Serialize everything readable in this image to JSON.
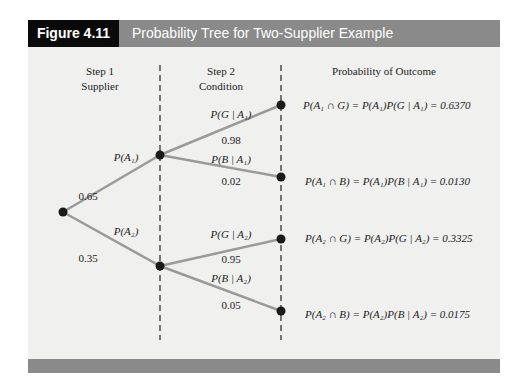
{
  "header": {
    "figure_label": "Figure 4.11",
    "title": "Probability Tree for Two-Supplier Example"
  },
  "columns": {
    "step1_line1": "Step 1",
    "step1_line2": "Supplier",
    "step2_line1": "Step 2",
    "step2_line2": "Condition",
    "outcome": "Probability of Outcome"
  },
  "branches": {
    "a1_label": "P(A₁)",
    "a1_value": "0.65",
    "a2_label": "P(A₂)",
    "a2_value": "0.35",
    "g_a1_label": "P(G | A₁)",
    "g_a1_value": "0.98",
    "b_a1_label": "P(B | A₁)",
    "b_a1_value": "0.02",
    "g_a2_label": "P(G | A₂)",
    "g_a2_value": "0.95",
    "b_a2_label": "P(B | A₂)",
    "b_a2_value": "0.05"
  },
  "outcomes": [
    {
      "formula": "P(A₁ ∩ G) = P(A₁)P(G | A₁) = 0.6370"
    },
    {
      "formula": "P(A₁ ∩ B) = P(A₁)P(B | A₁) = 0.0130"
    },
    {
      "formula": "P(A₂ ∩ G) = P(A₂)P(G | A₂) = 0.3325"
    },
    {
      "formula": "P(A₂ ∩ B) = P(A₂)P(B | A₂) = 0.0175"
    }
  ],
  "colors": {
    "header_bar": "#8a8a8a",
    "label_bg": "#0a0a0a",
    "branch_line": "#9a9a9a",
    "node": "#1a1a1a",
    "background": "#f0f0ee"
  }
}
